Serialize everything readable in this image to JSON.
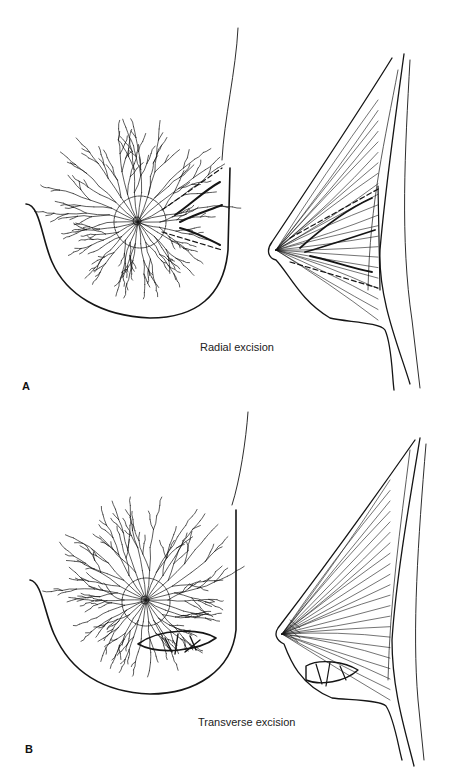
{
  "figure": {
    "panels": [
      {
        "letter": "A",
        "caption": "Radial excision",
        "views": [
          "frontal-view",
          "lateral-view"
        ]
      },
      {
        "letter": "B",
        "caption": "Transverse excision",
        "views": [
          "frontal-view",
          "lateral-view"
        ]
      }
    ],
    "colors": {
      "ink": "#151515",
      "background": "#ffffff"
    }
  }
}
